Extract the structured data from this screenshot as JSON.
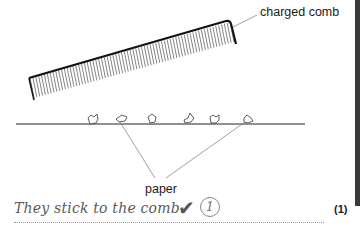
{
  "diagram": {
    "comb_label": "charged comb",
    "paper_label": "paper",
    "paper_piece_count": 6
  },
  "answer": {
    "text": "They stick to the comb.",
    "tick_icon": "check-mark",
    "awarded_mark": "1"
  },
  "question": {
    "marks_label": "(1)"
  },
  "colors": {
    "ink": "#1a1a1a",
    "handwriting": "#5a5a5a",
    "side_bar": "#3a3a3a"
  }
}
